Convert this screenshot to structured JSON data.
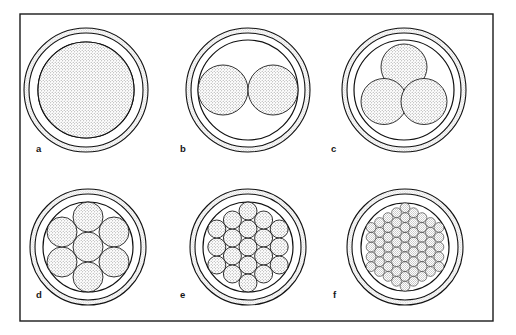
{
  "figure": {
    "background_color": "#ffffff",
    "frame": {
      "name": "figure-border",
      "x": 20,
      "y": 14,
      "width": 473,
      "height": 307,
      "stroke_color": "#1a1a1a",
      "stroke_width": 1.4,
      "fill": "#ffffff"
    },
    "style": {
      "outline_color": "#111111",
      "stipple_color": "#9a9a9a",
      "stipple_background": "#ffffff",
      "sheath_stipple_color": "#b0b0b0",
      "insulation_fill": "#ffffff",
      "label_color": "#161616"
    },
    "panels": [
      {
        "id": "a",
        "label": "a",
        "label_x": 36,
        "label_y": 152,
        "center_x": 86,
        "center_y": 90,
        "sheath_outer_r": 62,
        "sheath_inner_r": 57,
        "insulation_inner_r": 48,
        "strand_count": 1,
        "strand_radius": 48,
        "strands": [
          {
            "cx": 0,
            "cy": 0,
            "r": 48
          }
        ]
      },
      {
        "id": "b",
        "label": "b",
        "label_x": 180,
        "label_y": 152,
        "center_x": 248,
        "center_y": 90,
        "sheath_outer_r": 62,
        "sheath_inner_r": 57,
        "insulation_inner_r": 50,
        "strand_count": 2,
        "strand_radius": 25,
        "strands": [
          {
            "cx": -25,
            "cy": 0,
            "r": 25
          },
          {
            "cx": 25,
            "cy": 0,
            "r": 25
          }
        ]
      },
      {
        "id": "c",
        "label": "c",
        "label_x": 331,
        "label_y": 152,
        "center_x": 404,
        "center_y": 90,
        "sheath_outer_r": 62,
        "sheath_inner_r": 57,
        "insulation_inner_r": 50,
        "strand_count": 3,
        "strand_radius": 23,
        "strands": [
          {
            "cx": 0,
            "cy": -23,
            "r": 23
          },
          {
            "cx": -20,
            "cy": 11.5,
            "r": 23
          },
          {
            "cx": 20,
            "cy": 11.5,
            "r": 23
          }
        ]
      },
      {
        "id": "d",
        "label": "d",
        "label_x": 36,
        "label_y": 298,
        "center_x": 88,
        "center_y": 247,
        "sheath_outer_r": 58,
        "sheath_inner_r": 53,
        "insulation_inner_r": 45,
        "strand_count": 7,
        "strand_radius": 15,
        "strands": [
          {
            "cx": 0,
            "cy": 0,
            "r": 15
          },
          {
            "cx": 0,
            "cy": -30,
            "r": 15
          },
          {
            "cx": 26,
            "cy": -15,
            "r": 15
          },
          {
            "cx": 26,
            "cy": 15,
            "r": 15
          },
          {
            "cx": 0,
            "cy": 30,
            "r": 15
          },
          {
            "cx": -26,
            "cy": 15,
            "r": 15
          },
          {
            "cx": -26,
            "cy": -15,
            "r": 15
          }
        ]
      },
      {
        "id": "e",
        "label": "e",
        "label_x": 180,
        "label_y": 298,
        "center_x": 248,
        "center_y": 247,
        "sheath_outer_r": 58,
        "sheath_inner_r": 53,
        "insulation_inner_r": 45,
        "strand_count": 19,
        "strand_radius": 9,
        "strands": [
          {
            "cx": 0,
            "cy": 0,
            "r": 9
          },
          {
            "cx": 0,
            "cy": -18,
            "r": 9
          },
          {
            "cx": 15.6,
            "cy": -9,
            "r": 9
          },
          {
            "cx": 15.6,
            "cy": 9,
            "r": 9
          },
          {
            "cx": 0,
            "cy": 18,
            "r": 9
          },
          {
            "cx": -15.6,
            "cy": 9,
            "r": 9
          },
          {
            "cx": -15.6,
            "cy": -9,
            "r": 9
          },
          {
            "cx": 0,
            "cy": -36,
            "r": 9
          },
          {
            "cx": 15.6,
            "cy": -27,
            "r": 9
          },
          {
            "cx": 31.2,
            "cy": -18,
            "r": 9
          },
          {
            "cx": 31.2,
            "cy": 0,
            "r": 9
          },
          {
            "cx": 31.2,
            "cy": 18,
            "r": 9
          },
          {
            "cx": 15.6,
            "cy": 27,
            "r": 9
          },
          {
            "cx": 0,
            "cy": 36,
            "r": 9
          },
          {
            "cx": -15.6,
            "cy": 27,
            "r": 9
          },
          {
            "cx": -31.2,
            "cy": 18,
            "r": 9
          },
          {
            "cx": -31.2,
            "cy": 0,
            "r": 9
          },
          {
            "cx": -31.2,
            "cy": -18,
            "r": 9
          },
          {
            "cx": -15.6,
            "cy": -27,
            "r": 9
          }
        ]
      },
      {
        "id": "f",
        "label": "f",
        "label_x": 333,
        "label_y": 298,
        "center_x": 405,
        "center_y": 247,
        "sheath_outer_r": 58,
        "sheath_inner_r": 53,
        "insulation_inner_r": 44,
        "strand_count": 61,
        "strand_radius": 4.9,
        "strands": [
          {
            "cx": 0,
            "cy": 0,
            "r": 4.9
          },
          {
            "cx": 0,
            "cy": -9.8,
            "r": 4.9
          },
          {
            "cx": 8.49,
            "cy": -4.9,
            "r": 4.9
          },
          {
            "cx": 8.49,
            "cy": 4.9,
            "r": 4.9
          },
          {
            "cx": 0,
            "cy": 9.8,
            "r": 4.9
          },
          {
            "cx": -8.49,
            "cy": 4.9,
            "r": 4.9
          },
          {
            "cx": -8.49,
            "cy": -4.9,
            "r": 4.9
          },
          {
            "cx": 0,
            "cy": -19.6,
            "r": 4.9
          },
          {
            "cx": 8.49,
            "cy": -14.7,
            "r": 4.9
          },
          {
            "cx": 16.97,
            "cy": -9.8,
            "r": 4.9
          },
          {
            "cx": 16.97,
            "cy": 0,
            "r": 4.9
          },
          {
            "cx": 16.97,
            "cy": 9.8,
            "r": 4.9
          },
          {
            "cx": 8.49,
            "cy": 14.7,
            "r": 4.9
          },
          {
            "cx": 0,
            "cy": 19.6,
            "r": 4.9
          },
          {
            "cx": -8.49,
            "cy": 14.7,
            "r": 4.9
          },
          {
            "cx": -16.97,
            "cy": 9.8,
            "r": 4.9
          },
          {
            "cx": -16.97,
            "cy": 0,
            "r": 4.9
          },
          {
            "cx": -16.97,
            "cy": -9.8,
            "r": 4.9
          },
          {
            "cx": -8.49,
            "cy": -14.7,
            "r": 4.9
          },
          {
            "cx": 0,
            "cy": -29.4,
            "r": 4.9
          },
          {
            "cx": 8.49,
            "cy": -24.5,
            "r": 4.9
          },
          {
            "cx": 16.97,
            "cy": -19.6,
            "r": 4.9
          },
          {
            "cx": 25.46,
            "cy": -14.7,
            "r": 4.9
          },
          {
            "cx": 25.46,
            "cy": -4.9,
            "r": 4.9
          },
          {
            "cx": 25.46,
            "cy": 4.9,
            "r": 4.9
          },
          {
            "cx": 25.46,
            "cy": 14.7,
            "r": 4.9
          },
          {
            "cx": 16.97,
            "cy": 19.6,
            "r": 4.9
          },
          {
            "cx": 8.49,
            "cy": 24.5,
            "r": 4.9
          },
          {
            "cx": 0,
            "cy": 29.4,
            "r": 4.9
          },
          {
            "cx": -8.49,
            "cy": 24.5,
            "r": 4.9
          },
          {
            "cx": -16.97,
            "cy": 19.6,
            "r": 4.9
          },
          {
            "cx": -25.46,
            "cy": 14.7,
            "r": 4.9
          },
          {
            "cx": -25.46,
            "cy": 4.9,
            "r": 4.9
          },
          {
            "cx": -25.46,
            "cy": -4.9,
            "r": 4.9
          },
          {
            "cx": -25.46,
            "cy": -14.7,
            "r": 4.9
          },
          {
            "cx": -16.97,
            "cy": -19.6,
            "r": 4.9
          },
          {
            "cx": -8.49,
            "cy": -24.5,
            "r": 4.9
          },
          {
            "cx": 0,
            "cy": -39.2,
            "r": 4.9
          },
          {
            "cx": 8.49,
            "cy": -34.3,
            "r": 4.9
          },
          {
            "cx": 16.97,
            "cy": -29.4,
            "r": 4.9
          },
          {
            "cx": 25.46,
            "cy": -24.5,
            "r": 4.9
          },
          {
            "cx": 33.94,
            "cy": -19.6,
            "r": 4.9
          },
          {
            "cx": 33.94,
            "cy": -9.8,
            "r": 4.9
          },
          {
            "cx": 33.94,
            "cy": 0,
            "r": 4.9
          },
          {
            "cx": 33.94,
            "cy": 9.8,
            "r": 4.9
          },
          {
            "cx": 33.94,
            "cy": 19.6,
            "r": 4.9
          },
          {
            "cx": 25.46,
            "cy": 24.5,
            "r": 4.9
          },
          {
            "cx": 16.97,
            "cy": 29.4,
            "r": 4.9
          },
          {
            "cx": 8.49,
            "cy": 34.3,
            "r": 4.9
          },
          {
            "cx": 0,
            "cy": 39.2,
            "r": 4.9
          },
          {
            "cx": -8.49,
            "cy": 34.3,
            "r": 4.9
          },
          {
            "cx": -16.97,
            "cy": 29.4,
            "r": 4.9
          },
          {
            "cx": -25.46,
            "cy": 24.5,
            "r": 4.9
          },
          {
            "cx": -33.94,
            "cy": 19.6,
            "r": 4.9
          },
          {
            "cx": -33.94,
            "cy": 9.8,
            "r": 4.9
          },
          {
            "cx": -33.94,
            "cy": 0,
            "r": 4.9
          },
          {
            "cx": -33.94,
            "cy": -9.8,
            "r": 4.9
          },
          {
            "cx": -33.94,
            "cy": -19.6,
            "r": 4.9
          },
          {
            "cx": -25.46,
            "cy": -24.5,
            "r": 4.9
          },
          {
            "cx": -16.97,
            "cy": -29.4,
            "r": 4.9
          },
          {
            "cx": -8.49,
            "cy": -34.3,
            "r": 4.9
          }
        ]
      }
    ]
  }
}
